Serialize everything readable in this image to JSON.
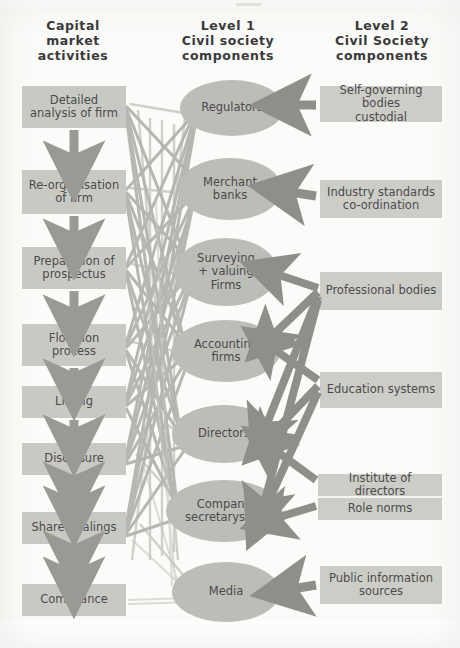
{
  "headers": {
    "left": "Capital\nmarket\nactivities",
    "middle": "Level 1\nCivil society\ncomponents",
    "right": "Level 2\nCivil Society\ncomponents"
  },
  "left_column": {
    "title": "Capital market activities",
    "items": [
      {
        "id": "detailed-analysis",
        "label": "Detailed\nanalysis of firm"
      },
      {
        "id": "re-organisation",
        "label": "Re-organisation\nof firm"
      },
      {
        "id": "preparation",
        "label": "Preparation of\nprospectus"
      },
      {
        "id": "flotation",
        "label": "Flotation\nprocess"
      },
      {
        "id": "listing",
        "label": "Listing"
      },
      {
        "id": "disclosure",
        "label": "Disclosure"
      },
      {
        "id": "share-dealings",
        "label": "Share dealings"
      },
      {
        "id": "compliance",
        "label": "Compliance"
      }
    ],
    "connectors": [
      {
        "from": "detailed-analysis",
        "to": "re-organisation",
        "direction": "down"
      },
      {
        "from": "re-organisation",
        "to": "preparation",
        "direction": "down"
      },
      {
        "from": "preparation",
        "to": "flotation",
        "direction": "down"
      },
      {
        "from": "flotation",
        "to": "listing",
        "direction": "down"
      },
      {
        "from": "listing",
        "to": "disclosure",
        "direction": "down"
      },
      {
        "from": "disclosure",
        "to": "share-dealings",
        "direction": "both"
      },
      {
        "from": "share-dealings",
        "to": "compliance",
        "direction": "both"
      }
    ]
  },
  "middle_column": {
    "title": "Level 1 Civil society components",
    "items": [
      {
        "id": "regulators",
        "label": "Regulators"
      },
      {
        "id": "merchant",
        "label": "Merchant\nbanks"
      },
      {
        "id": "surveying",
        "label": "Surveying\n+ valuing\nFirms"
      },
      {
        "id": "accounting",
        "label": "Accounting\nfirms"
      },
      {
        "id": "directors",
        "label": "Directors"
      },
      {
        "id": "company-sec",
        "label": "Company\nsecretaryship"
      },
      {
        "id": "media",
        "label": "Media"
      }
    ]
  },
  "right_column": {
    "title": "Level 2 Civil Society components",
    "items": [
      {
        "id": "self-governing",
        "label": "Self-governing bodies\ncustodial",
        "targets": [
          "regulators"
        ]
      },
      {
        "id": "industry",
        "label": "Industry standards\nco-ordination",
        "targets": [
          "merchant"
        ]
      },
      {
        "id": "professional",
        "label": "Professional bodies",
        "targets": [
          "surveying",
          "accounting",
          "directors",
          "company-sec"
        ]
      },
      {
        "id": "education",
        "label": "Education systems",
        "targets": [
          "accounting",
          "directors",
          "company-sec"
        ]
      },
      {
        "id": "institute",
        "label": "Institute of directors",
        "targets": [
          "directors",
          "company-sec"
        ]
      },
      {
        "id": "role-norms",
        "label": "Role norms",
        "targets": [
          "company-sec"
        ]
      },
      {
        "id": "public-info",
        "label": "Public information\nsources",
        "targets": [
          "media"
        ]
      }
    ]
  },
  "colors": {
    "background": "#fbfbf9",
    "box_fill": "#c9c9c4",
    "ellipse_fill": "#bdbdb8",
    "arrow_gray": "#8f8f8a",
    "web_line": "#9d9d98",
    "text": "#4a4a4a",
    "heading_text": "#3a3a3a"
  },
  "meta": {
    "type": "flow-diagram",
    "web_description": "dense crossing lines linking every capital-market activity to every Level 1 civil society component"
  }
}
